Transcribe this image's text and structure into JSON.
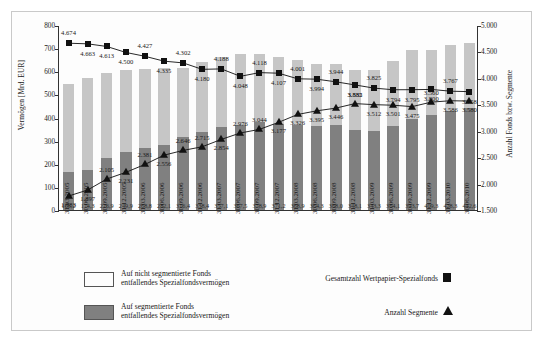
{
  "chart_data": {
    "type": "bar",
    "title": "",
    "subtitle": "",
    "ylabel": "Vermögen [Mrd. EUR]",
    "ylabel_right": "Anzahl Fonds bzw. Segmente",
    "xlabel": "",
    "ylim": [
      0,
      800
    ],
    "yticks": [
      "0",
      "100",
      "200",
      "300",
      "400",
      "500",
      "600",
      "700",
      "800"
    ],
    "ylim_right": [
      1500,
      5000
    ],
    "yticks_right": [
      "1.500",
      "2.000",
      "2.500",
      "3.000",
      "3.500",
      "4.000",
      "4.500",
      "5.000"
    ],
    "grid": false,
    "legend_position": "bottom",
    "categories": [
      "31.03.2005",
      "30.06.2005",
      "30.09.2005",
      "31.12.2005",
      "31.03.2006",
      "30.06.2006",
      "30.09.2006",
      "31.12.2006",
      "31.03.2007",
      "30.06.2007",
      "30.09.2007",
      "31.12.2007",
      "31.03.2008",
      "30.06.2008",
      "30.09.2008",
      "31.12.2008",
      "31.03.2009",
      "30.06.2009",
      "30.09.2009",
      "31.12.2009",
      "31.03.2010",
      "30.06.2010"
    ],
    "series": [
      {
        "name": "Auf segmentierte Fonds entfallendes Spezialfondsvermögen",
        "type": "bar-stack",
        "color": "#808080",
        "axis": "left",
        "values": [
          166.2,
          174.3,
          226.9,
          249.9,
          268.8,
          282.1,
          316.4,
          338.4,
          357.1,
          367.5,
          378.9,
          371.2,
          368.9,
          364.3,
          368.0,
          348.1,
          343.3,
          364.1,
          393.7,
          409.3,
          428.3,
          442.6
        ],
        "labels": [
          "166,2",
          "174,3",
          "226,9",
          "249,9",
          "268,8",
          "282,1",
          "316,4",
          "338,4",
          "357,1",
          "367,5",
          "378,9",
          "371,2",
          "368,9",
          "364,3",
          "368,0",
          "348,1",
          "343,3",
          "364,1",
          "393,7",
          "409,3",
          "428,3",
          "442,6"
        ]
      },
      {
        "name": "Auf nicht segmentierte Fonds entfallendes Spezialfondsvermögen",
        "type": "bar-stack",
        "color": "#c6c6c6",
        "axis": "left",
        "values": [
          378.0,
          396.0,
          367.0,
          355.0,
          343.0,
          330.0,
          297.0,
          303.0,
          305.0,
          308.0,
          296.0,
          292.0,
          279.0,
          267.0,
          264.0,
          257.0,
          261.0,
          279.0,
          299.0,
          283.0,
          287.0,
          281.0
        ]
      },
      {
        "name": "Gesamtzahl Wertpapier-Spezialfonds",
        "type": "line",
        "marker": "square",
        "color": "#111111",
        "axis": "right",
        "values": [
          4674,
          4663,
          4613,
          4500,
          4427,
          4335,
          4302,
          4180,
          4188,
          4048,
          4118,
          4107,
          4001,
          3994,
          3944,
          3885,
          3825,
          3794,
          3795,
          3800,
          3767,
          3758
        ],
        "labels": [
          "4.674",
          "4.663",
          "4.613",
          "4.500",
          "4.427",
          "4.335",
          "4.302",
          "4.180",
          "4.188",
          "4.048",
          "4.118",
          "4.107",
          "4.001",
          "3.994",
          "3.944",
          "3.885",
          "3.825",
          "3.794",
          "3.795",
          "3.800",
          "3.767",
          "3.758"
        ]
      },
      {
        "name": "Anzahl Segmente",
        "type": "line",
        "marker": "triangle",
        "color": "#111111",
        "axis": "right",
        "values": [
          1783,
          1897,
          2105,
          2231,
          2381,
          2556,
          2646,
          2715,
          2854,
          2976,
          3044,
          3177,
          3326,
          3395,
          3446,
          3532,
          3512,
          3501,
          3475,
          3560,
          3586,
          3580
        ],
        "labels": [
          "1.783",
          "1.897",
          "2.105",
          "2.231",
          "2.381",
          "2.556",
          "2.646",
          "2.715",
          "2.854",
          "2.976",
          "3.044",
          "3.177",
          "3.326",
          "3.395",
          "3.446",
          "3.532",
          "3.512",
          "3.501",
          "3.475",
          "3.560",
          "3.586",
          "3.580"
        ]
      }
    ]
  },
  "legend": {
    "items": [
      {
        "kind": "swatch",
        "color": "#c6c6c6",
        "line1": "Auf nicht segmentierte Fonds",
        "line2": "entfallendes Spezialfondsvermögen"
      },
      {
        "kind": "swatch",
        "color": "#808080",
        "line1": "Auf segmentierte Fonds",
        "line2": "entfallendes Spezialfondsvermögen"
      }
    ],
    "right_items": [
      {
        "kind": "square",
        "label": "Gesamtzahl Wertpapier-Spezialfonds"
      },
      {
        "kind": "triangle",
        "label": "Anzahl Segmente"
      }
    ]
  }
}
